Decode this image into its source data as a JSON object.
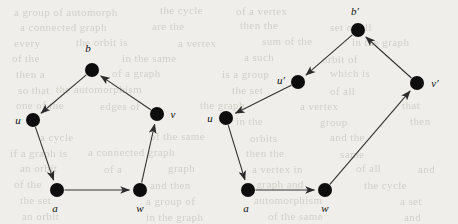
{
  "figure": {
    "type": "directed-graph-pair",
    "background_color": "#efeeea",
    "node_color": "#0d0d0d",
    "edge_color": "#333333",
    "node_radius": 7
  },
  "ghost_text": [
    {
      "text": "a group of automorph",
      "x": 14,
      "y": 6
    },
    {
      "text": "the cycle",
      "x": 160,
      "y": 4
    },
    {
      "text": "of a vertex",
      "x": 236,
      "y": 5
    },
    {
      "text": "a connected graph",
      "x": 20,
      "y": 21
    },
    {
      "text": "are the",
      "x": 152,
      "y": 20
    },
    {
      "text": "then the",
      "x": 240,
      "y": 19
    },
    {
      "text": "set of all",
      "x": 330,
      "y": 21
    },
    {
      "text": "every",
      "x": 14,
      "y": 37
    },
    {
      "text": "the orbit is",
      "x": 76,
      "y": 36
    },
    {
      "text": "a vertex",
      "x": 178,
      "y": 37
    },
    {
      "text": "sum of the",
      "x": 262,
      "y": 35
    },
    {
      "text": "in the graph",
      "x": 352,
      "y": 36
    },
    {
      "text": "of the",
      "x": 12,
      "y": 52
    },
    {
      "text": "in the same",
      "x": 122,
      "y": 52
    },
    {
      "text": "a such",
      "x": 244,
      "y": 51
    },
    {
      "text": "orbit of",
      "x": 322,
      "y": 53
    },
    {
      "text": "then a",
      "x": 16,
      "y": 68
    },
    {
      "text": "of a graph",
      "x": 112,
      "y": 67
    },
    {
      "text": "is a group",
      "x": 222,
      "y": 68
    },
    {
      "text": "which is",
      "x": 330,
      "y": 67
    },
    {
      "text": "so that",
      "x": 18,
      "y": 84
    },
    {
      "text": "the automorphism",
      "x": 56,
      "y": 83
    },
    {
      "text": "the set",
      "x": 232,
      "y": 84
    },
    {
      "text": "of all",
      "x": 330,
      "y": 85
    },
    {
      "text": "one of the",
      "x": 16,
      "y": 99
    },
    {
      "text": "edges of",
      "x": 100,
      "y": 100
    },
    {
      "text": "the graph",
      "x": 200,
      "y": 99
    },
    {
      "text": "a vertex",
      "x": 300,
      "y": 100
    },
    {
      "text": "that",
      "x": 402,
      "y": 99
    },
    {
      "text": "in the",
      "x": 236,
      "y": 115
    },
    {
      "text": "group",
      "x": 320,
      "y": 116
    },
    {
      "text": "then",
      "x": 410,
      "y": 115
    },
    {
      "text": "a cycle",
      "x": 40,
      "y": 131
    },
    {
      "text": "of the same",
      "x": 150,
      "y": 130
    },
    {
      "text": "orbits",
      "x": 250,
      "y": 132
    },
    {
      "text": "and the",
      "x": 330,
      "y": 131
    },
    {
      "text": "if a graph is",
      "x": 10,
      "y": 147
    },
    {
      "text": "a connected graph",
      "x": 88,
      "y": 146
    },
    {
      "text": "then the",
      "x": 246,
      "y": 147
    },
    {
      "text": "same",
      "x": 340,
      "y": 148
    },
    {
      "text": "an orbit",
      "x": 20,
      "y": 162
    },
    {
      "text": "of a",
      "x": 104,
      "y": 163
    },
    {
      "text": "graph",
      "x": 168,
      "y": 162
    },
    {
      "text": "a vertex in",
      "x": 252,
      "y": 163
    },
    {
      "text": "of all",
      "x": 356,
      "y": 162
    },
    {
      "text": "and",
      "x": 418,
      "y": 163
    },
    {
      "text": "of the",
      "x": 14,
      "y": 178
    },
    {
      "text": "and then",
      "x": 150,
      "y": 179
    },
    {
      "text": "a graph and",
      "x": 248,
      "y": 178
    },
    {
      "text": "the cycle",
      "x": 364,
      "y": 179
    },
    {
      "text": "the set",
      "x": 20,
      "y": 194
    },
    {
      "text": "a group of",
      "x": 146,
      "y": 195
    },
    {
      "text": "automorphism",
      "x": 254,
      "y": 194
    },
    {
      "text": "a set",
      "x": 400,
      "y": 195
    },
    {
      "text": "an orbit",
      "x": 22,
      "y": 210
    },
    {
      "text": "in the graph",
      "x": 146,
      "y": 211
    },
    {
      "text": "of the same",
      "x": 268,
      "y": 210
    },
    {
      "text": "and",
      "x": 404,
      "y": 211
    }
  ],
  "graphs": [
    {
      "id": "left-graph",
      "name": "pentagon-cycle-graph",
      "nodes": [
        {
          "id": "b",
          "label": "b",
          "x": 92,
          "y": 70,
          "label_x": 88,
          "label_y": 48
        },
        {
          "id": "u",
          "label": "u",
          "x": 33,
          "y": 120,
          "label_x": 18,
          "label_y": 120
        },
        {
          "id": "v",
          "label": "v",
          "x": 157,
          "y": 114,
          "label_x": 173,
          "label_y": 114
        },
        {
          "id": "a",
          "label": "a",
          "x": 57,
          "y": 190,
          "label_x": 55,
          "label_y": 208
        },
        {
          "id": "w",
          "label": "w",
          "x": 140,
          "y": 190,
          "label_x": 140,
          "label_y": 208
        }
      ],
      "edges": [
        {
          "from": "b",
          "to": "u"
        },
        {
          "from": "u",
          "to": "a"
        },
        {
          "from": "a",
          "to": "w"
        },
        {
          "from": "w",
          "to": "v"
        },
        {
          "from": "v",
          "to": "b"
        }
      ]
    },
    {
      "id": "right-graph",
      "name": "hexagon-cycle-graph",
      "nodes": [
        {
          "id": "bp",
          "label": "b′",
          "x": 358,
          "y": 30,
          "label_x": 355,
          "label_y": 11
        },
        {
          "id": "up",
          "label": "u′",
          "x": 298,
          "y": 82,
          "label_x": 281,
          "label_y": 80
        },
        {
          "id": "vp",
          "label": "v′",
          "x": 417,
          "y": 83,
          "label_x": 435,
          "label_y": 83
        },
        {
          "id": "u",
          "label": "u",
          "x": 226,
          "y": 118,
          "label_x": 210,
          "label_y": 118
        },
        {
          "id": "a",
          "label": "a",
          "x": 248,
          "y": 190,
          "label_x": 246,
          "label_y": 208
        },
        {
          "id": "w",
          "label": "w",
          "x": 325,
          "y": 190,
          "label_x": 325,
          "label_y": 208
        }
      ],
      "edges": [
        {
          "from": "bp",
          "to": "up"
        },
        {
          "from": "up",
          "to": "u"
        },
        {
          "from": "u",
          "to": "a"
        },
        {
          "from": "a",
          "to": "w"
        },
        {
          "from": "w",
          "to": "vp"
        },
        {
          "from": "vp",
          "to": "bp"
        }
      ]
    }
  ]
}
